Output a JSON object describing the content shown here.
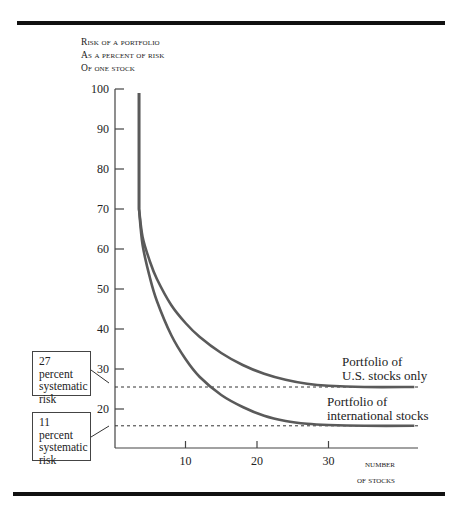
{
  "chart_data": {
    "type": "line",
    "title": "",
    "ylabel": "Risk of a portfolio as a percent of risk of one stock",
    "ylabel_lines": [
      "Risk of a portfolio",
      "as a percent of risk",
      "of one stock"
    ],
    "xlabel": "Number of stocks",
    "xlabel_lines": [
      "Number",
      "of stocks"
    ],
    "y_ticks": [
      100,
      90,
      80,
      70,
      60,
      50,
      40,
      30,
      20
    ],
    "x_ticks": [
      10,
      20,
      30
    ],
    "ylim": [
      10,
      100
    ],
    "xlim": [
      0,
      42
    ],
    "grid": false,
    "legend_position": "inline right",
    "series": [
      {
        "name": "Portfolio of U.S. stocks only",
        "label_lines": [
          "Portfolio of",
          "U.S. stocks only"
        ],
        "x": [
          3.5,
          3.5,
          4,
          5,
          6,
          8,
          10,
          12,
          15,
          18,
          21,
          24,
          27,
          30,
          35,
          42
        ],
        "values": [
          99,
          70,
          63,
          57,
          52.5,
          46,
          41.5,
          38,
          34,
          31,
          28.8,
          27.3,
          26.3,
          25.8,
          25.5,
          25.5
        ]
      },
      {
        "name": "Portfolio of international stocks",
        "label_lines": [
          "Portfolio of",
          "international stocks"
        ],
        "x": [
          3.5,
          3.5,
          4,
          5,
          6,
          8,
          10,
          12,
          15,
          18,
          21,
          24,
          27,
          30,
          35,
          42
        ],
        "values": [
          99,
          70,
          61,
          53,
          47,
          38.5,
          32.5,
          28,
          23.5,
          20.5,
          18.3,
          17,
          16.3,
          16,
          15.8,
          15.8
        ]
      }
    ],
    "reference_lines": [
      {
        "y": 25.5,
        "style": "dashed",
        "label": "27 percent systematic risk"
      },
      {
        "y": 15.8,
        "style": "dashed",
        "label": "11 percent systematic risk"
      }
    ],
    "annotations": [
      {
        "text_lines": [
          "27 percent",
          "systematic",
          "risk"
        ],
        "points_to": "U.S. asymptote"
      },
      {
        "text_lines": [
          "11 percent",
          "systematic",
          "risk"
        ],
        "points_to": "international asymptote"
      }
    ]
  },
  "colors": {
    "curve": "#5a5a5a",
    "axis": "#444444",
    "rule": "#111111"
  }
}
